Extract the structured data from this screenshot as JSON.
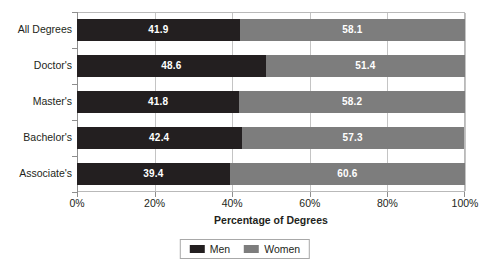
{
  "chart_data": {
    "type": "bar",
    "orientation": "horizontal",
    "stacked": true,
    "stack_total": 100,
    "title": "",
    "xlabel": "Percentage of Degrees",
    "ylabel": "",
    "xlim": [
      0,
      100
    ],
    "xtick_labels": [
      "0%",
      "20%",
      "40%",
      "60%",
      "80%",
      "100%"
    ],
    "xtick_values": [
      0,
      20,
      40,
      60,
      80,
      100
    ],
    "grid": "vertical",
    "legend_position": "bottom",
    "categories": [
      "All Degrees",
      "Doctor's",
      "Master's",
      "Bachelor's",
      "Associate's"
    ],
    "series": [
      {
        "name": "Men",
        "color": "#231f20",
        "values": [
          41.9,
          48.6,
          41.8,
          42.4,
          39.4
        ],
        "labels": [
          "41.9",
          "48.6",
          "41.8",
          "42.4",
          "39.4"
        ]
      },
      {
        "name": "Women",
        "color": "#7d7d7d",
        "values": [
          58.1,
          51.4,
          58.2,
          57.3,
          60.6
        ],
        "labels": [
          "58.1",
          "51.4",
          "58.2",
          "57.3",
          "60.6"
        ]
      }
    ]
  },
  "legend": {
    "entries": [
      {
        "label": "Men",
        "color": "#231f20"
      },
      {
        "label": "Women",
        "color": "#7d7d7d"
      }
    ]
  }
}
